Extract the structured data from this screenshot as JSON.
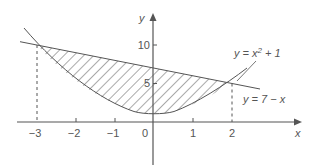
{
  "figure": {
    "axes": {
      "x_label": "x",
      "y_label": "y",
      "x_ticks": [
        {
          "value": -3,
          "label": "−3"
        },
        {
          "value": -2,
          "label": "−2"
        },
        {
          "value": -1,
          "label": "−1"
        },
        {
          "value": 0,
          "label": "0"
        },
        {
          "value": 1,
          "label": "1"
        },
        {
          "value": 2,
          "label": "2"
        }
      ],
      "y_ticks": [
        {
          "value": 5,
          "label": "5"
        },
        {
          "value": 10,
          "label": "10"
        }
      ]
    },
    "curves": [
      {
        "name": "parabola",
        "label_lhs": "y = x",
        "label_sup": "2",
        "label_rhs": " + 1"
      },
      {
        "name": "line",
        "label": "y = 7 − x"
      }
    ],
    "shaded_region": {
      "from_x": -3,
      "to_x": 2,
      "pattern": "hatched"
    },
    "intersections": [
      {
        "x": -3,
        "y": 10
      },
      {
        "x": 2,
        "y": 5
      }
    ],
    "colors": {
      "ink": "#555555",
      "background": "#ffffff"
    }
  }
}
